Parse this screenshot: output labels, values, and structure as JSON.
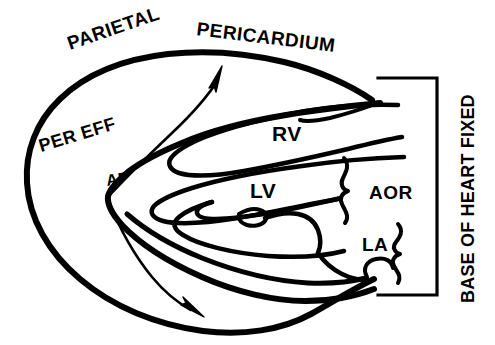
{
  "figure": {
    "type": "anatomical-line-diagram",
    "canvas": {
      "width": 495,
      "height": 345
    },
    "ink_color": "#000000",
    "background_color": "#ffffff"
  },
  "labels": {
    "parietal": "PARIETAL",
    "pericardium": "PERICARDIUM",
    "per_eff": "PER EFF",
    "ap": "AP",
    "rv": "RV",
    "lv": "LV",
    "aor": "AOR",
    "la": "LA",
    "base_of_heart_fixed": "BASE OF HEART FIXED"
  },
  "annotations": {
    "arrow_upper": "swing-arrow-upper",
    "arrow_lower": "swing-arrow-lower",
    "bracket": "base-of-heart-bracket",
    "brace_aorta": "aorta-brace",
    "brace_atrium": "atrium-brace"
  }
}
